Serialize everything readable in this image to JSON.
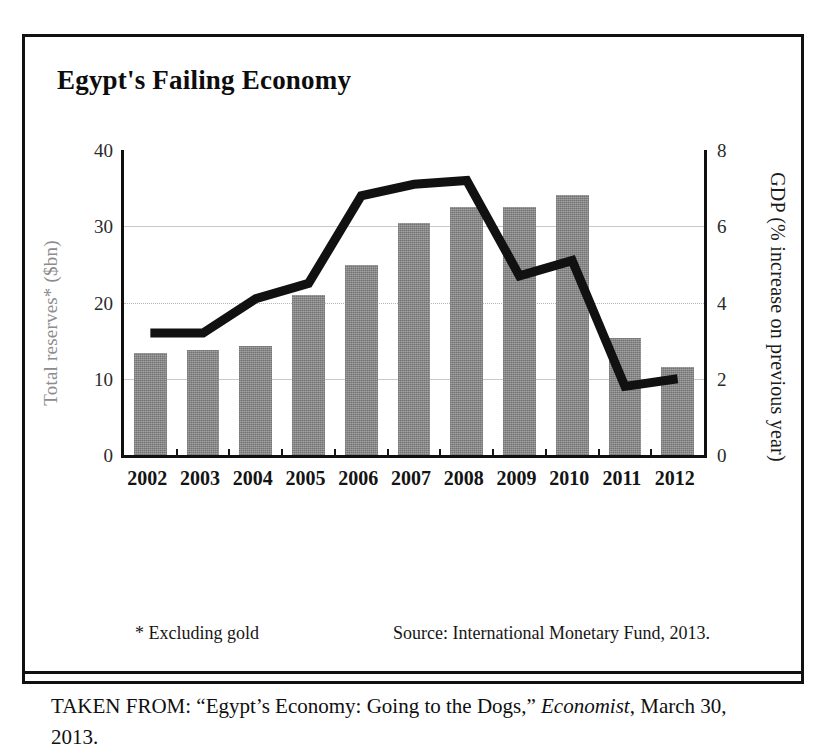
{
  "figure": {
    "title": "Egypt's Failing Economy",
    "footnote_star": "* Excluding gold",
    "source": "Source: International Monetary Fund, 2013.",
    "caption_prefix": "TAKEN FROM: “Egypt’s Economy: Going to the Dogs,” ",
    "caption_italic": "Economist",
    "caption_suffix": ", March 30, 2013."
  },
  "colors": {
    "bar_fill": "#8d8d8d",
    "line_stroke": "#111111",
    "frame": "#111111",
    "gridline": "#c9c9c9"
  },
  "chart_data": {
    "type": "bar",
    "title": "Egypt's Failing Economy",
    "xlabel": "",
    "categories": [
      "2002",
      "2003",
      "2004",
      "2005",
      "2006",
      "2007",
      "2008",
      "2009",
      "2010",
      "2011",
      "2012"
    ],
    "grid": true,
    "legend": "none",
    "axes": {
      "left": {
        "label": "Total reserves* ($bn)",
        "ticks": [
          "0",
          "10",
          "20",
          "30",
          "40"
        ],
        "tick_values": [
          0,
          10,
          20,
          30,
          40
        ],
        "range": [
          0,
          40
        ],
        "series_type": "bar"
      },
      "right": {
        "label": "GDP (% increase on previous year)",
        "ticks": [
          "0",
          "2",
          "4",
          "6",
          "8"
        ],
        "tick_values": [
          0,
          2,
          4,
          6,
          8
        ],
        "range": [
          0,
          8
        ],
        "series_type": "line"
      }
    },
    "series": [
      {
        "name": "Total reserves* ($bn)",
        "type": "bar",
        "axis": "left",
        "values": [
          13.4,
          13.8,
          14.3,
          21.0,
          24.9,
          30.4,
          32.5,
          32.5,
          34.1,
          15.3,
          11.6
        ]
      },
      {
        "name": "GDP (% increase on previous year)",
        "type": "line",
        "axis": "right",
        "values": [
          3.2,
          3.2,
          4.1,
          4.5,
          6.8,
          7.1,
          7.2,
          4.7,
          5.1,
          1.8,
          2.0
        ]
      }
    ]
  }
}
